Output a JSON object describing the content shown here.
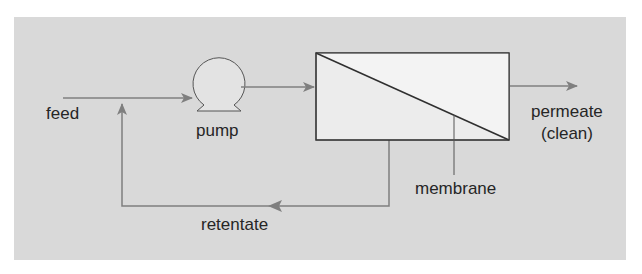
{
  "diagram": {
    "colors": {
      "background": "#d9d9d9",
      "line": "#7f7f7f",
      "outline": "#3a3a3a",
      "membrane_box": "#ececec",
      "text": "#262626"
    },
    "labels": {
      "feed": "feed",
      "pump": "pump",
      "permeate_line1": "permeate",
      "permeate_line2": "(clean)",
      "membrane": "membrane",
      "retentate": "retentate"
    },
    "components": [
      {
        "id": "pump",
        "icon": "pump-icon"
      },
      {
        "id": "membrane-module",
        "icon": "membrane-module-icon"
      }
    ],
    "flows": [
      {
        "from": "feed",
        "to": "pump"
      },
      {
        "from": "pump",
        "to": "membrane-module"
      },
      {
        "from": "membrane-module",
        "to": "permeate"
      },
      {
        "from": "membrane-module",
        "to": "retentate (recycle to feed)"
      }
    ]
  }
}
